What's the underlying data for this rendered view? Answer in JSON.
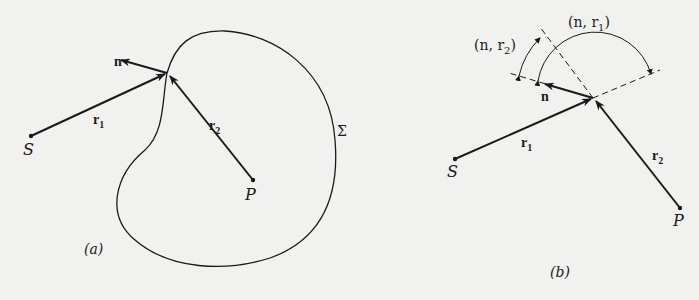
{
  "panel_a": {
    "caption": "(a)",
    "labels": {
      "n": "n",
      "r1": "r",
      "r1_sub": "1",
      "r2": "r",
      "r2_sub": "2",
      "S": "S",
      "P": "P",
      "surface": "Σ"
    }
  },
  "panel_b": {
    "caption": "(b)",
    "labels": {
      "n": "n",
      "r1": "r",
      "r1_sub": "1",
      "r2": "r",
      "r2_sub": "2",
      "S": "S",
      "P": "P",
      "angle_n_r1": "(n, r",
      "angle_n_r1_sub": "1",
      "angle_n_r1_close": ")",
      "angle_n_r2": "(n, r",
      "angle_n_r2_sub": "2",
      "angle_n_r2_close": ")"
    }
  },
  "colors": {
    "ink": "#1a1a1a",
    "paper": "#f1f1ef"
  }
}
